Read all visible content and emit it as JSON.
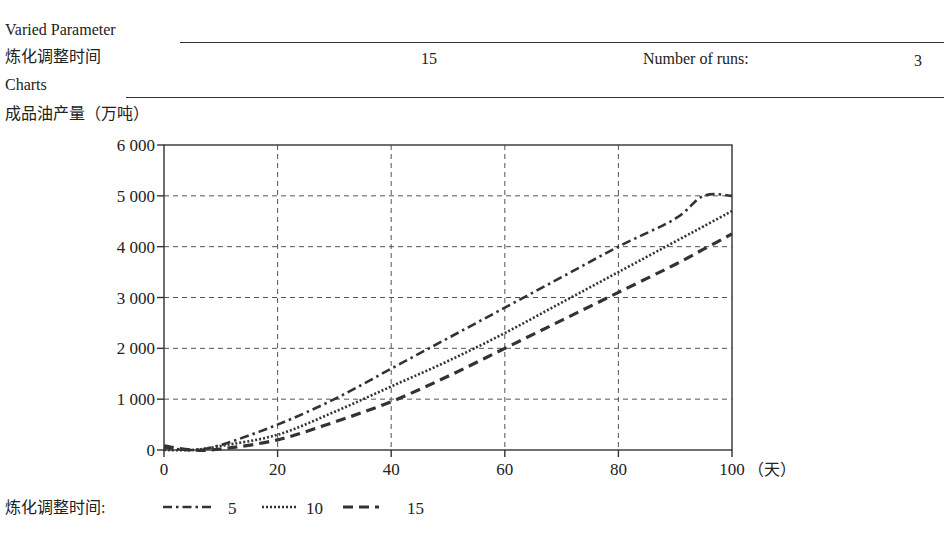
{
  "header": {
    "varied_parameter_label": "Varied Parameter",
    "parameter_name": "炼化调整时间",
    "parameter_value": "15",
    "runs_label": "Number of runs:",
    "runs_value": "3",
    "charts_label": "Charts"
  },
  "chart_data": {
    "type": "line",
    "title": "成品油产量（万吨）",
    "xlabel": "（天）",
    "ylabel": "成品油产量（万吨）",
    "xlim": [
      0,
      100
    ],
    "ylim": [
      0,
      6000
    ],
    "x_ticks": [
      0,
      20,
      40,
      60,
      80,
      100
    ],
    "x_tick_labels": [
      "0",
      "20",
      "40",
      "60",
      "80",
      "100"
    ],
    "y_ticks": [
      0,
      1000,
      2000,
      3000,
      4000,
      5000,
      6000
    ],
    "y_tick_labels": [
      "0",
      "1 000",
      "2 000",
      "3 000",
      "4 000",
      "5 000",
      "6 000"
    ],
    "grid": true,
    "legend_position": "bottom",
    "legend_title": "炼化调整时间:",
    "x": [
      0,
      5,
      10,
      20,
      30,
      40,
      50,
      60,
      70,
      80,
      90,
      95,
      100
    ],
    "series": [
      {
        "name": "5",
        "style": "dash-dot",
        "values": [
          50,
          0,
          100,
          500,
          1000,
          1600,
          2200,
          2800,
          3400,
          4000,
          4550,
          5000,
          5000
        ]
      },
      {
        "name": "10",
        "style": "dotted",
        "values": [
          0,
          0,
          80,
          300,
          750,
          1250,
          1750,
          2300,
          2900,
          3500,
          4100,
          4400,
          4700
        ]
      },
      {
        "name": "15",
        "style": "dashed",
        "values": [
          80,
          0,
          20,
          200,
          550,
          950,
          1450,
          2000,
          2550,
          3100,
          3650,
          3950,
          4250
        ]
      }
    ]
  },
  "colors": {
    "line": "#333333",
    "grid": "#555555",
    "text": "#222222"
  }
}
